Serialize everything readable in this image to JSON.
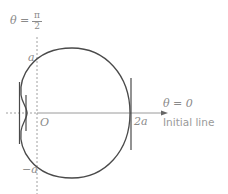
{
  "diagram": {
    "type": "polar-curve",
    "labels": {
      "theta_half_pi_left": "θ =",
      "pi": "π",
      "two": "2",
      "a_top": "a",
      "origin": "O",
      "two_a": "2a",
      "neg_a": "−a",
      "theta_zero": "θ = 0",
      "initial_line": "Initial line"
    },
    "colors": {
      "curve": "#4a4a4a",
      "axis": "#9a9a9a",
      "text": "#8a8a8a"
    }
  }
}
